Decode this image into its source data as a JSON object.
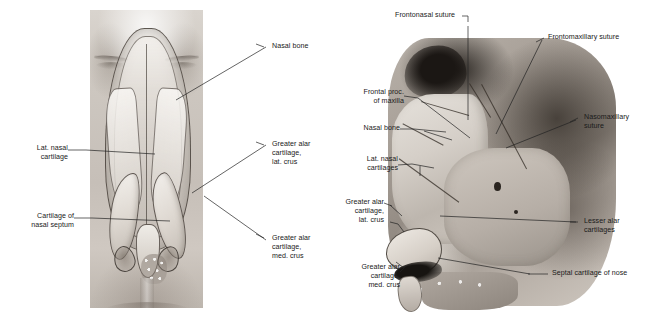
{
  "figure": {
    "panels": [
      {
        "id": "frontal",
        "caption": "Frontal view of external nose with cartilages"
      },
      {
        "id": "lateral",
        "caption": "Lateral view of nasal skeleton and cartilages"
      }
    ]
  },
  "left_panel": {
    "labels": [
      {
        "id": "nasal-bone",
        "text": "Nasal bone",
        "align": "left"
      },
      {
        "id": "lat-nasal-cartilage",
        "text": "Lat. nasal\ncartilage",
        "align": "right"
      },
      {
        "id": "cartilage-nasal-septum",
        "text": "Cartilage of\nnasal septum",
        "align": "right"
      },
      {
        "id": "greater-alar-lat-crus",
        "text": "Greater alar\ncartilage,\nlat. crus",
        "align": "left"
      },
      {
        "id": "greater-alar-med-crus",
        "text": "Greater alar\ncartilage,\nmed. crus",
        "align": "left"
      }
    ]
  },
  "right_panel": {
    "labels": [
      {
        "id": "frontonasal-suture",
        "text": "Frontonasal suture",
        "align": "left"
      },
      {
        "id": "frontomaxillary-suture",
        "text": "Frontomaxillary suture",
        "align": "left"
      },
      {
        "id": "frontal-proc-maxilla",
        "text": "Frontal proc.\nof maxilla",
        "align": "right"
      },
      {
        "id": "nasal-bone",
        "text": "Nasal bone",
        "align": "right"
      },
      {
        "id": "lat-nasal-cartilages",
        "text": "Lat. nasal\ncartilages",
        "align": "right"
      },
      {
        "id": "greater-alar-lat-crus",
        "text": "Greater alar\ncartilage,\nlat. crus",
        "align": "right"
      },
      {
        "id": "greater-alar-med-crus",
        "text": "Greater alar\ncartilage,\nmed. crus",
        "align": "right"
      },
      {
        "id": "nasomaxillary-suture",
        "text": "Nasomaxillary\nsuture",
        "align": "left"
      },
      {
        "id": "lesser-alar-cartilages",
        "text": "Lesser alar\ncartilages",
        "align": "left"
      },
      {
        "id": "septal-cartilage-nose",
        "text": "Septal cartilage of nose",
        "align": "left"
      }
    ]
  },
  "colors": {
    "background": "#ffffff",
    "label_text": "#1a1a1a",
    "leader_line": "#232323",
    "illustration_midtone": "#b5ada5",
    "illustration_shadow": "#2a241f",
    "illustration_highlight": "#efebe5"
  }
}
